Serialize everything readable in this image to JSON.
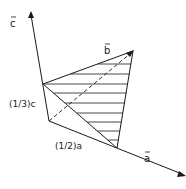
{
  "figure": {
    "type": "vector-diagram",
    "labels": {
      "c_axis": "c",
      "b_vector": "b",
      "a_axis": "a",
      "third_c": "(1/3)c",
      "half_a": "(1/2)a"
    },
    "vector_marker": "→",
    "points": {
      "origin": [
        49,
        121
      ],
      "c_tip": [
        31,
        12
      ],
      "a_tip": [
        185,
        175
      ],
      "b_tip": [
        133,
        51
      ],
      "third_c": [
        43,
        84
      ],
      "half_a": [
        117,
        148
      ]
    },
    "hatch_count": 9,
    "colors": {
      "line": "#1a1a1a",
      "background": "#ffffff"
    }
  }
}
